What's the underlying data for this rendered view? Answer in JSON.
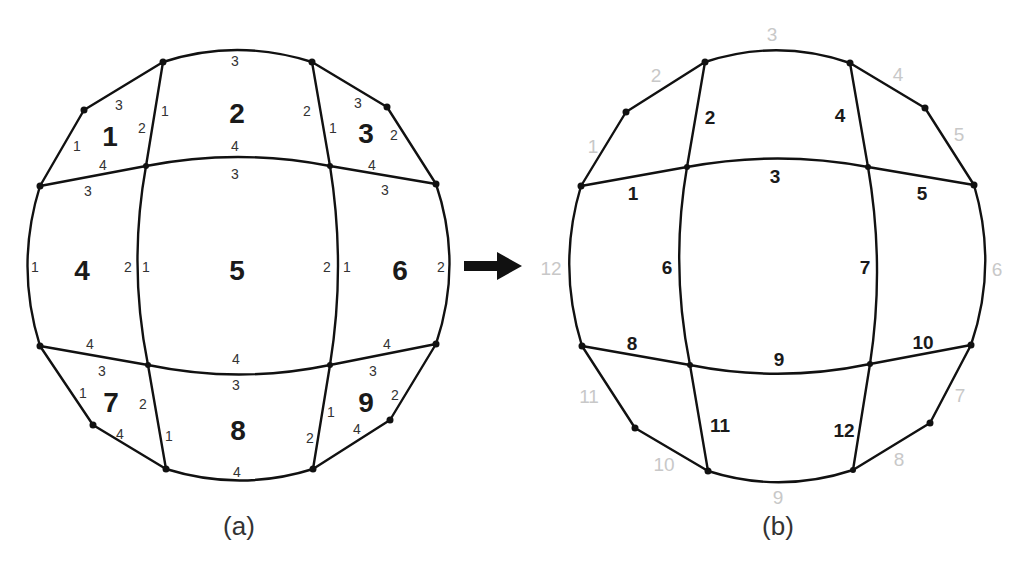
{
  "figure": {
    "panel_a": {
      "caption": "(a)",
      "element_labels": [
        {
          "id": "1",
          "x": 110,
          "y": 136
        },
        {
          "id": "2",
          "x": 237,
          "y": 113
        },
        {
          "id": "3",
          "x": 366,
          "y": 133
        },
        {
          "id": "4",
          "x": 82,
          "y": 270
        },
        {
          "id": "5",
          "x": 237,
          "y": 270
        },
        {
          "id": "6",
          "x": 400,
          "y": 270
        },
        {
          "id": "7",
          "x": 111,
          "y": 402
        },
        {
          "id": "8",
          "x": 238,
          "y": 430
        },
        {
          "id": "9",
          "x": 366,
          "y": 402
        }
      ],
      "local_edge_labels": [
        {
          "t": "3",
          "x": 235,
          "y": 61
        },
        {
          "t": "3",
          "x": 119,
          "y": 105
        },
        {
          "t": "1",
          "x": 77,
          "y": 146
        },
        {
          "t": "2",
          "x": 142,
          "y": 128
        },
        {
          "t": "1",
          "x": 165,
          "y": 111
        },
        {
          "t": "4",
          "x": 103,
          "y": 165
        },
        {
          "t": "2",
          "x": 307,
          "y": 111
        },
        {
          "t": "1",
          "x": 333,
          "y": 128
        },
        {
          "t": "3",
          "x": 358,
          "y": 103
        },
        {
          "t": "2",
          "x": 394,
          "y": 135
        },
        {
          "t": "4",
          "x": 235,
          "y": 146
        },
        {
          "t": "3",
          "x": 235,
          "y": 174
        },
        {
          "t": "4",
          "x": 372,
          "y": 165
        },
        {
          "t": "3",
          "x": 88,
          "y": 191
        },
        {
          "t": "3",
          "x": 385,
          "y": 190
        },
        {
          "t": "1",
          "x": 35,
          "y": 267
        },
        {
          "t": "2",
          "x": 128,
          "y": 267
        },
        {
          "t": "1",
          "x": 146,
          "y": 267
        },
        {
          "t": "2",
          "x": 327,
          "y": 267
        },
        {
          "t": "1",
          "x": 347,
          "y": 267
        },
        {
          "t": "2",
          "x": 441,
          "y": 267
        },
        {
          "t": "4",
          "x": 90,
          "y": 344
        },
        {
          "t": "4",
          "x": 236,
          "y": 359
        },
        {
          "t": "4",
          "x": 387,
          "y": 344
        },
        {
          "t": "3",
          "x": 102,
          "y": 371
        },
        {
          "t": "3",
          "x": 236,
          "y": 385
        },
        {
          "t": "3",
          "x": 373,
          "y": 371
        },
        {
          "t": "1",
          "x": 83,
          "y": 393
        },
        {
          "t": "2",
          "x": 143,
          "y": 404
        },
        {
          "t": "1",
          "x": 169,
          "y": 436
        },
        {
          "t": "2",
          "x": 395,
          "y": 395
        },
        {
          "t": "1",
          "x": 331,
          "y": 412
        },
        {
          "t": "2",
          "x": 310,
          "y": 438
        },
        {
          "t": "4",
          "x": 120,
          "y": 434
        },
        {
          "t": "4",
          "x": 357,
          "y": 429
        },
        {
          "t": "4",
          "x": 237,
          "y": 472
        }
      ]
    },
    "panel_b": {
      "caption": "(b)",
      "inner_edge_labels": [
        {
          "t": "1",
          "x": 633,
          "y": 193
        },
        {
          "t": "2",
          "x": 710,
          "y": 117
        },
        {
          "t": "3",
          "x": 775,
          "y": 176
        },
        {
          "t": "4",
          "x": 840,
          "y": 115
        },
        {
          "t": "5",
          "x": 922,
          "y": 193
        },
        {
          "t": "6",
          "x": 667,
          "y": 267
        },
        {
          "t": "7",
          "x": 865,
          "y": 267
        },
        {
          "t": "8",
          "x": 632,
          "y": 343
        },
        {
          "t": "9",
          "x": 779,
          "y": 359
        },
        {
          "t": "10",
          "x": 923,
          "y": 342
        },
        {
          "t": "11",
          "x": 720,
          "y": 425
        },
        {
          "t": "12",
          "x": 844,
          "y": 430
        }
      ],
      "boundary_edge_labels": [
        {
          "t": "1",
          "x": 593,
          "y": 146
        },
        {
          "t": "2",
          "x": 656,
          "y": 75
        },
        {
          "t": "3",
          "x": 772,
          "y": 34
        },
        {
          "t": "4",
          "x": 898,
          "y": 74
        },
        {
          "t": "5",
          "x": 959,
          "y": 134
        },
        {
          "t": "6",
          "x": 997,
          "y": 269
        },
        {
          "t": "7",
          "x": 960,
          "y": 395
        },
        {
          "t": "8",
          "x": 899,
          "y": 459
        },
        {
          "t": "9",
          "x": 778,
          "y": 497
        },
        {
          "t": "10",
          "x": 664,
          "y": 464
        },
        {
          "t": "11",
          "x": 589,
          "y": 396
        },
        {
          "t": "12",
          "x": 551,
          "y": 268
        }
      ]
    },
    "arrow": {
      "direction": "right"
    },
    "colors": {
      "line": "#111111",
      "inner_label": "#1a1a1a",
      "boundary_label": "#c8c8c8"
    }
  }
}
